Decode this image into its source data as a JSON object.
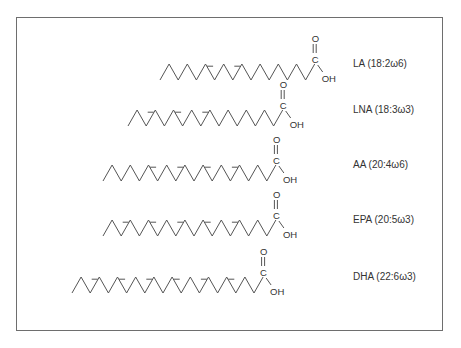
{
  "figure": {
    "type": "chemical-structure-diagram",
    "stroke_color": "#555555",
    "frame_color": "#6e6e6e"
  },
  "molecules": [
    {
      "name": "LA",
      "label": "LA (18:2ω6)",
      "carbons": 18,
      "double_bonds": 2,
      "omega": 6,
      "y": 72,
      "start_x": 160,
      "bonds": [
        "s",
        "s",
        "s",
        "s",
        "s",
        "d",
        "s",
        "s",
        "d",
        "s",
        "s",
        "s",
        "s",
        "s",
        "s",
        "s",
        "s"
      ]
    },
    {
      "name": "LNA",
      "label": "LNA (18:3ω3)",
      "carbons": 18,
      "double_bonds": 3,
      "omega": 3,
      "y": 118,
      "start_x": 128,
      "bonds": [
        "s",
        "s",
        "d",
        "s",
        "s",
        "d",
        "s",
        "s",
        "d",
        "s",
        "s",
        "s",
        "s",
        "s",
        "s",
        "s",
        "s"
      ]
    },
    {
      "name": "AA",
      "label": "AA (20:4ω6)",
      "carbons": 20,
      "double_bonds": 4,
      "omega": 6,
      "y": 173,
      "start_x": 103,
      "bonds": [
        "s",
        "s",
        "s",
        "s",
        "s",
        "d",
        "s",
        "s",
        "d",
        "s",
        "s",
        "d",
        "s",
        "s",
        "d",
        "s",
        "s",
        "s",
        "s"
      ]
    },
    {
      "name": "EPA",
      "label": "EPA (20:5ω3)",
      "carbons": 20,
      "double_bonds": 5,
      "omega": 3,
      "y": 228,
      "start_x": 103,
      "bonds": [
        "s",
        "s",
        "d",
        "s",
        "s",
        "d",
        "s",
        "s",
        "d",
        "s",
        "s",
        "d",
        "s",
        "s",
        "d",
        "s",
        "s",
        "s",
        "s"
      ]
    },
    {
      "name": "DHA",
      "label": "DHA (22:6ω3)",
      "carbons": 22,
      "double_bonds": 6,
      "omega": 3,
      "y": 285,
      "start_x": 72,
      "bonds": [
        "s",
        "s",
        "d",
        "s",
        "s",
        "d",
        "s",
        "s",
        "d",
        "s",
        "s",
        "d",
        "s",
        "s",
        "d",
        "s",
        "s",
        "d",
        "s",
        "s",
        "s"
      ]
    }
  ],
  "functional_group": {
    "carbonyl_O": "O",
    "carbon": "C",
    "hydroxyl": "OH"
  },
  "label_x": 353
}
